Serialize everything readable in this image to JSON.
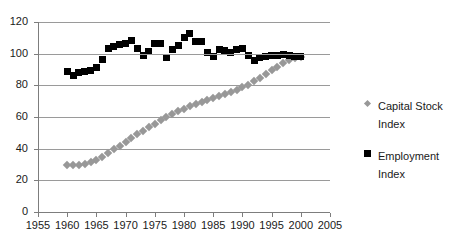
{
  "chart_data": {
    "type": "scatter",
    "title": "",
    "xlabel": "",
    "ylabel": "",
    "xlim": [
      1955,
      2005
    ],
    "ylim": [
      0,
      120
    ],
    "grid": true,
    "legend_position": "right",
    "x_ticks": [
      "1955",
      "1960",
      "1965",
      "1970",
      "1975",
      "1980",
      "1985",
      "1990",
      "1995",
      "2000",
      "2005"
    ],
    "y_ticks": [
      "0",
      "20",
      "40",
      "60",
      "80",
      "100",
      "120"
    ],
    "series": [
      {
        "name": "Capital Stock Index",
        "marker": "diamond",
        "color": "#989898",
        "x": [
          1960,
          1961,
          1962,
          1963,
          1964,
          1965,
          1966,
          1967,
          1968,
          1969,
          1970,
          1971,
          1972,
          1973,
          1974,
          1975,
          1976,
          1977,
          1978,
          1979,
          1980,
          1981,
          1982,
          1983,
          1984,
          1985,
          1986,
          1987,
          1988,
          1989,
          1990,
          1991,
          1992,
          1993,
          1994,
          1995,
          1996,
          1997,
          1998,
          1999,
          2000
        ],
        "values": [
          29.5,
          29.6,
          30.0,
          30.6,
          31.5,
          32.8,
          34.8,
          37.0,
          39.5,
          42.0,
          44.5,
          46.8,
          49.0,
          51.2,
          53.5,
          55.8,
          58.0,
          60.0,
          61.8,
          63.5,
          65.2,
          66.8,
          68.2,
          69.5,
          70.8,
          72.0,
          73.2,
          74.5,
          75.8,
          77.2,
          78.8,
          80.5,
          82.5,
          84.8,
          87.2,
          89.5,
          91.8,
          94.0,
          95.8,
          97.2,
          98.2
        ]
      },
      {
        "name": "Employment Index",
        "marker": "square",
        "color": "#000000",
        "x": [
          1960,
          1961,
          1962,
          1963,
          1964,
          1965,
          1966,
          1967,
          1968,
          1969,
          1970,
          1971,
          1972,
          1973,
          1974,
          1975,
          1976,
          1977,
          1978,
          1979,
          1980,
          1981,
          1982,
          1983,
          1984,
          1985,
          1986,
          1987,
          1988,
          1989,
          1990,
          1991,
          1992,
          1993,
          1994,
          1995,
          1996,
          1997,
          1998,
          1999,
          2000
        ],
        "values": [
          88.5,
          86.0,
          88.0,
          89.0,
          89.5,
          91.0,
          96.5,
          103.0,
          104.5,
          105.5,
          106.5,
          108.5,
          103.5,
          99.0,
          101.5,
          106.5,
          106.5,
          97.5,
          102.5,
          105.0,
          110.0,
          112.5,
          107.5,
          107.5,
          100.5,
          98.0,
          102.5,
          102.0,
          100.5,
          102.5,
          103.0,
          99.0,
          96.0,
          97.5,
          98.5,
          99.0,
          99.0,
          99.5,
          99.0,
          98.5,
          98.0
        ]
      }
    ]
  },
  "legend": {
    "items": [
      {
        "label": "Capital Stock Index"
      },
      {
        "label": "Employment Index"
      }
    ]
  }
}
